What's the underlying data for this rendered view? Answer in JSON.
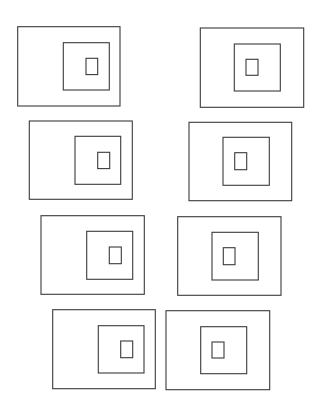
{
  "diagram": {
    "width": 322,
    "height": 411,
    "background": "#ffffff",
    "stroke_color": "#3a3a3a",
    "figures": [
      {
        "id": "figure-1",
        "row": 1,
        "column": "left",
        "outer": {
          "x": 17.7,
          "y": 26.7,
          "w": 102.3,
          "h": 79.3
        },
        "middle": {
          "x": 63.3,
          "y": 42.7,
          "w": 46.0,
          "h": 47.3
        },
        "inner": {
          "x": 86.0,
          "y": 58.3,
          "w": 11.7,
          "h": 16.3
        }
      },
      {
        "id": "figure-2",
        "row": 1,
        "column": "right",
        "outer": {
          "x": 200.3,
          "y": 28.0,
          "w": 103.4,
          "h": 79.3
        },
        "middle": {
          "x": 234.3,
          "y": 44.0,
          "w": 46.0,
          "h": 47.0
        },
        "inner": {
          "x": 246.0,
          "y": 59.3,
          "w": 12.0,
          "h": 16.0
        }
      },
      {
        "id": "figure-3",
        "row": 2,
        "column": "left",
        "outer": {
          "x": 29.3,
          "y": 121.0,
          "w": 103.0,
          "h": 78.3
        },
        "middle": {
          "x": 75.0,
          "y": 136.3,
          "w": 45.7,
          "h": 48.0
        },
        "inner": {
          "x": 97.7,
          "y": 152.3,
          "w": 12.0,
          "h": 16.3
        }
      },
      {
        "id": "figure-4",
        "row": 2,
        "column": "right",
        "outer": {
          "x": 189.0,
          "y": 122.3,
          "w": 102.7,
          "h": 78.4
        },
        "middle": {
          "x": 223.0,
          "y": 137.3,
          "w": 46.3,
          "h": 48.0
        },
        "inner": {
          "x": 234.7,
          "y": 152.7,
          "w": 12.0,
          "h": 17.0
        }
      },
      {
        "id": "figure-5",
        "row": 3,
        "column": "left",
        "outer": {
          "x": 41.0,
          "y": 215.7,
          "w": 103.3,
          "h": 78.6
        },
        "middle": {
          "x": 86.7,
          "y": 231.3,
          "w": 46.0,
          "h": 48.0
        },
        "inner": {
          "x": 109.3,
          "y": 247.0,
          "w": 12.0,
          "h": 16.7
        }
      },
      {
        "id": "figure-6",
        "row": 3,
        "column": "right",
        "outer": {
          "x": 177.7,
          "y": 216.7,
          "w": 103.3,
          "h": 78.6
        },
        "middle": {
          "x": 212.0,
          "y": 232.3,
          "w": 46.3,
          "h": 47.7
        },
        "inner": {
          "x": 223.3,
          "y": 247.7,
          "w": 11.7,
          "h": 17.0
        }
      },
      {
        "id": "figure-7",
        "row": 4,
        "column": "left",
        "outer": {
          "x": 52.7,
          "y": 309.7,
          "w": 102.6,
          "h": 79.0
        },
        "middle": {
          "x": 98.3,
          "y": 325.7,
          "w": 45.7,
          "h": 47.3
        },
        "inner": {
          "x": 120.7,
          "y": 341.0,
          "w": 12.0,
          "h": 16.7
        }
      },
      {
        "id": "figure-8",
        "row": 4,
        "column": "right",
        "outer": {
          "x": 166.0,
          "y": 310.7,
          "w": 103.7,
          "h": 79.0
        },
        "middle": {
          "x": 200.7,
          "y": 326.7,
          "w": 46.0,
          "h": 47.0
        },
        "inner": {
          "x": 212.0,
          "y": 342.0,
          "w": 12.0,
          "h": 16.0
        }
      }
    ]
  }
}
